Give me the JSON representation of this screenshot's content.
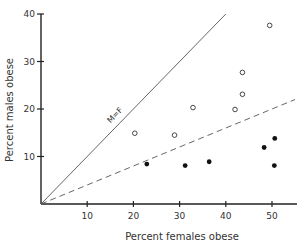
{
  "chart_data": {
    "type": "scatter",
    "title": "",
    "xlabel": "Percent females obese",
    "ylabel": "Percent males obese",
    "xlim": [
      0,
      55
    ],
    "ylim": [
      0,
      40
    ],
    "xticks": [
      10,
      20,
      30,
      40,
      50
    ],
    "yticks": [
      10,
      20,
      30,
      40
    ],
    "grid": false,
    "legend": null,
    "series": [
      {
        "name": "open circles",
        "marker": "open-circle",
        "points": [
          [
            20.3,
            14.9
          ],
          [
            28.9,
            14.5
          ],
          [
            32.9,
            20.3
          ],
          [
            42.0,
            19.9
          ],
          [
            43.6,
            23.1
          ],
          [
            43.6,
            27.7
          ],
          [
            49.5,
            37.6
          ]
        ]
      },
      {
        "name": "filled circles",
        "marker": "filled-circle",
        "points": [
          [
            22.9,
            8.4
          ],
          [
            31.2,
            8.1
          ],
          [
            36.4,
            8.9
          ],
          [
            48.3,
            11.9
          ],
          [
            50.5,
            8.1
          ],
          [
            50.6,
            13.8
          ]
        ]
      }
    ],
    "reference_lines": [
      {
        "name": "M=F",
        "style": "solid",
        "from": [
          0,
          0
        ],
        "to": [
          40,
          40
        ],
        "label": "M=F"
      },
      {
        "name": "dashed",
        "style": "dashed",
        "from": [
          0,
          0
        ],
        "to": [
          55,
          22
        ]
      }
    ]
  }
}
